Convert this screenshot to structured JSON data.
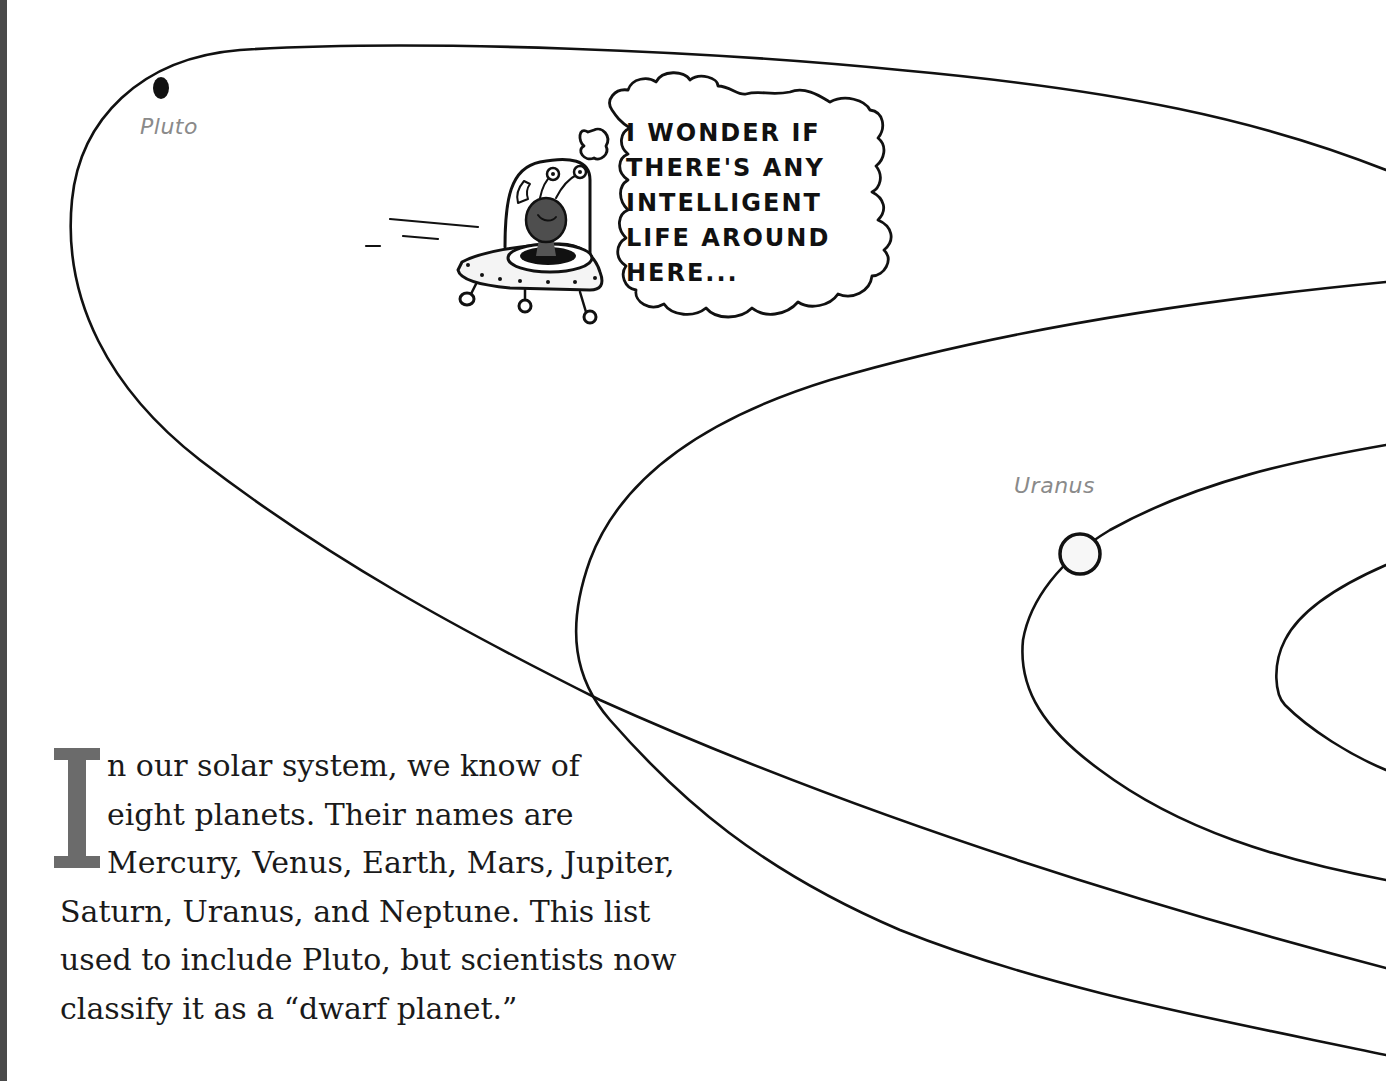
{
  "page": {
    "background": "#ffffff",
    "spine_color": "#4a4a4a"
  },
  "illustration": {
    "planets": [
      {
        "name": "Pluto",
        "label": "Pluto",
        "marker": "filled-dot"
      },
      {
        "name": "Uranus",
        "label": "Uranus",
        "marker": "open-circle"
      }
    ],
    "orbits_count": 5,
    "ufo": {
      "description": "alien in flying saucer with antennae",
      "thought_bubble": {
        "lines": [
          "I wonder if",
          "there's any",
          "intelligent",
          "life around",
          "here..."
        ]
      }
    }
  },
  "text": {
    "drop_cap": "I",
    "drop_cap_color": "#6b6b6b",
    "lines": [
      "n our solar system, we know of",
      "eight planets. Their names are",
      "Mercury, Venus, Earth, Mars, Jupiter,",
      "Saturn, Uranus, and Neptune. This list",
      "used to include Pluto, but scientists now",
      "classify it as a “dwarf planet.”"
    ]
  }
}
